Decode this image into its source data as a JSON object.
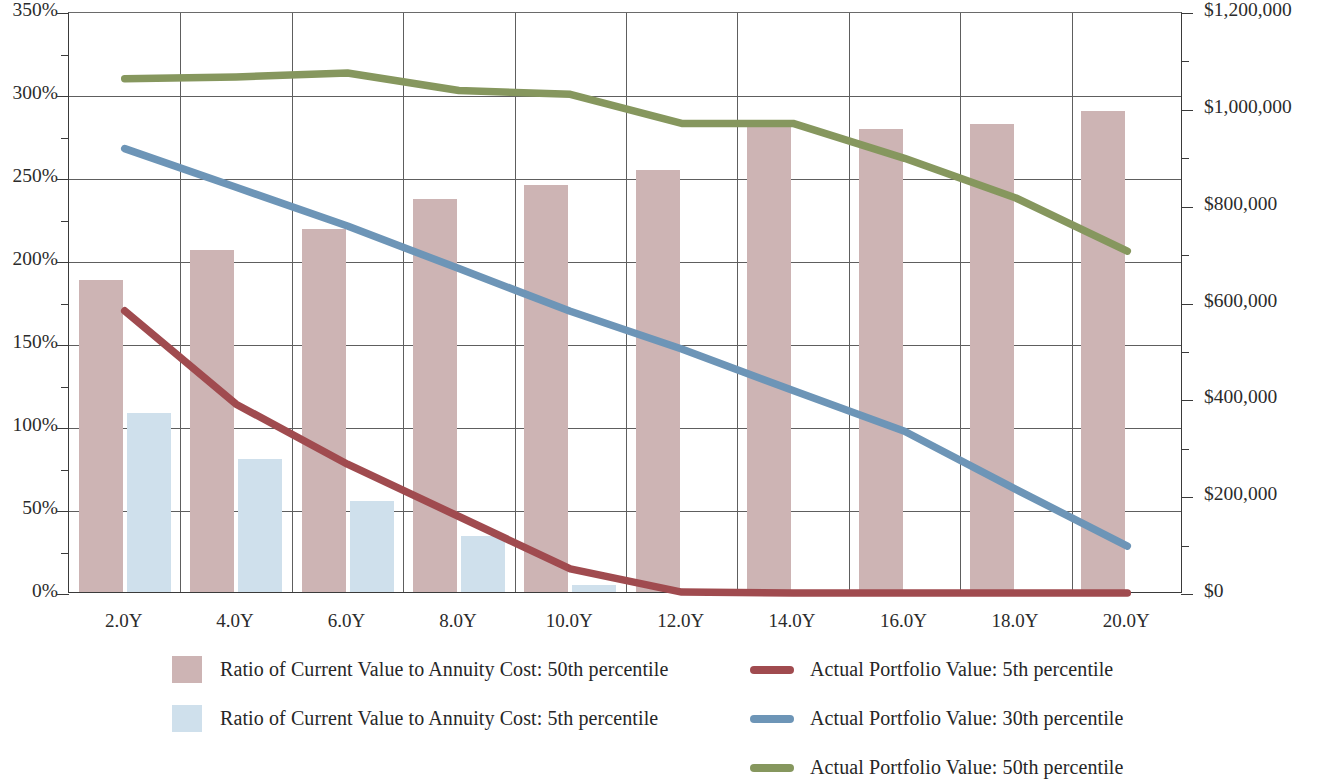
{
  "chart_data": {
    "type": "bar",
    "title": "",
    "subtitle": "",
    "xlabel": "",
    "categories": [
      "2.0Y",
      "4.0Y",
      "6.0Y",
      "8.0Y",
      "10.0Y",
      "12.0Y",
      "14.0Y",
      "16.0Y",
      "18.0Y",
      "20.0Y"
    ],
    "grid": true,
    "legend_position": "bottom",
    "axes": {
      "left": {
        "label": "",
        "ylim": [
          0,
          350
        ],
        "unit": "%",
        "major_step": 50,
        "minor_step": 25,
        "tick_labels": [
          "0%",
          "50%",
          "100%",
          "150%",
          "200%",
          "250%",
          "300%",
          "350%"
        ],
        "tick_values": [
          0,
          50,
          100,
          150,
          200,
          250,
          300,
          350
        ]
      },
      "right": {
        "label": "",
        "ylim": [
          0,
          1200000
        ],
        "unit": "$",
        "major_step": 200000,
        "minor_step": 100000,
        "tick_labels": [
          "$0",
          "$200,000",
          "$400,000",
          "$600,000",
          "$800,000",
          "$1,000,000",
          "$1,200,000"
        ],
        "tick_values": [
          0,
          200000,
          400000,
          600000,
          800000,
          1000000,
          1200000
        ]
      }
    },
    "bar_series": [
      {
        "name": "Ratio of Current Value to Annuity Cost: 50th percentile",
        "axis": "left",
        "color": "#cdb4b4",
        "values": [
          188,
          206,
          219,
          237,
          245,
          254,
          280,
          279,
          282,
          290
        ]
      },
      {
        "name": "Ratio of Current Value to Annuity Cost: 5th percentile",
        "axis": "left",
        "color": "#cfe0ec",
        "values": [
          108,
          80,
          55,
          34,
          4,
          0,
          0,
          0,
          0,
          0
        ]
      }
    ],
    "line_series": [
      {
        "name": "Actual Portfolio Value: 5th percentile",
        "axis": "right",
        "color": "#a04b4f",
        "values": [
          585000,
          392000,
          268000,
          160000,
          52000,
          4000,
          2000,
          2000,
          2000,
          2000
        ]
      },
      {
        "name": "Actual Portfolio Value: 30th percentile",
        "axis": "right",
        "color": "#6d95b7",
        "values": [
          920000,
          840000,
          760000,
          672000,
          584000,
          506000,
          420000,
          336000,
          216000,
          99000
        ]
      },
      {
        "name": "Actual Portfolio Value: 50th percentile",
        "axis": "right",
        "color": "#86975e",
        "values": [
          1064000,
          1068000,
          1076000,
          1040000,
          1032000,
          972000,
          972000,
          900000,
          818000,
          708000
        ]
      }
    ]
  },
  "legend": {
    "left_column": [
      {
        "label": "Ratio of Current Value to Annuity Cost: 50th percentile",
        "color": "#cdb4b4",
        "marker": "box"
      },
      {
        "label": "Ratio of Current Value to Annuity Cost: 5th percentile",
        "color": "#cfe0ec",
        "marker": "box"
      }
    ],
    "right_column": [
      {
        "label": "Actual Portfolio Value: 5th percentile",
        "color": "#a04b4f",
        "marker": "line"
      },
      {
        "label": "Actual Portfolio Value: 30th percentile",
        "color": "#6d95b7",
        "marker": "line"
      },
      {
        "label": "Actual Portfolio Value: 50th percentile",
        "color": "#86975e",
        "marker": "line"
      }
    ]
  }
}
